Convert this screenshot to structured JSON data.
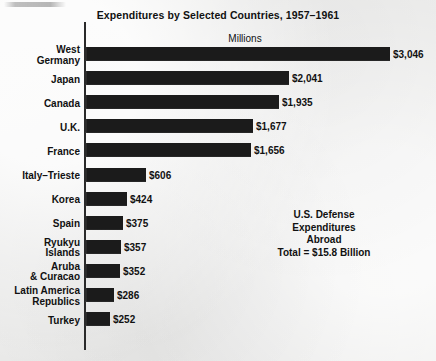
{
  "chart_data": {
    "type": "bar",
    "orientation": "horizontal",
    "title": "Expenditures by Selected Countries, 1957–1961",
    "xlabel": "Millions",
    "ylabel": "",
    "grid": false,
    "axis_header": "Millions",
    "xlim": [
      0,
      3046
    ],
    "categories": [
      "West\nGermany",
      "Japan",
      "Canada",
      "U.K.",
      "France",
      "Italy–Trieste",
      "Korea",
      "Spain",
      "Ryukyu\nIslands",
      "Aruba\n& Curacao",
      "Latin America\nRepublics",
      "Turkey"
    ],
    "values": [
      3046,
      2041,
      1935,
      1677,
      1656,
      606,
      424,
      375,
      357,
      352,
      286,
      252
    ],
    "value_labels": [
      "$3,046",
      "$2,041",
      "$1,935",
      "$1,677",
      "$1,656",
      "$606",
      "$424",
      "$375",
      "$357",
      "$352",
      "$286",
      "$252"
    ],
    "annotation": [
      "U.S. Defense",
      "Expenditures",
      "Abroad",
      "Total = $15.8 Billion"
    ],
    "bar_color": "#1b1b1b",
    "background_color": "#ededec",
    "text_color": "#111111"
  }
}
